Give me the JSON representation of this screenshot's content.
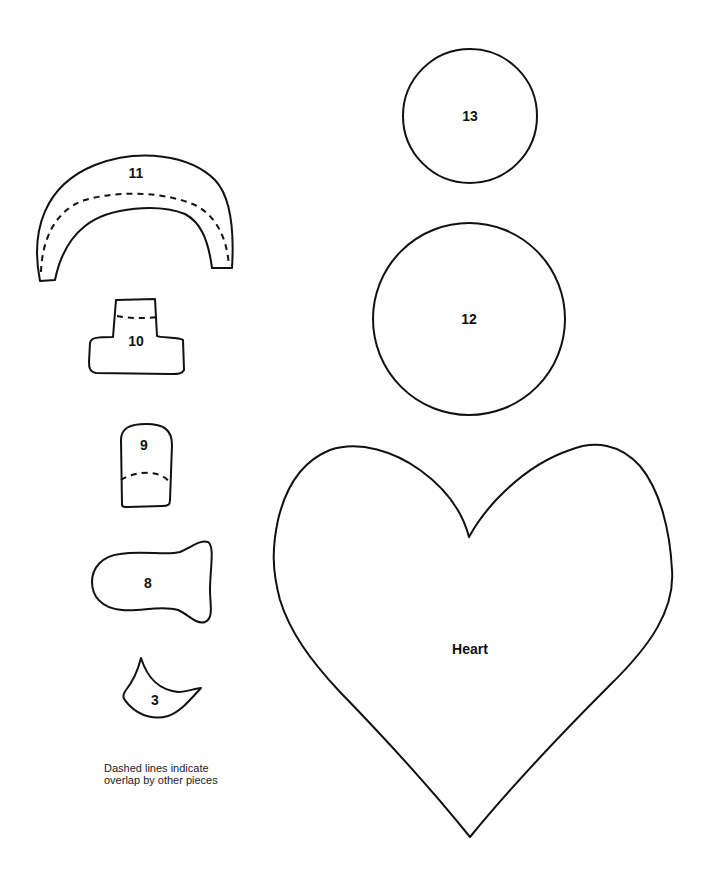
{
  "pieces": {
    "piece_11": {
      "label": "11",
      "has_dashed_overlap": true
    },
    "piece_10": {
      "label": "10",
      "has_dashed_overlap": true
    },
    "piece_9": {
      "label": "9",
      "has_dashed_overlap": true
    },
    "piece_8": {
      "label": "8",
      "has_dashed_overlap": false
    },
    "piece_3": {
      "label": "3",
      "has_dashed_overlap": false
    },
    "piece_13": {
      "label": "13",
      "shape": "circle"
    },
    "piece_12": {
      "label": "12",
      "shape": "circle"
    },
    "heart": {
      "label": "Heart",
      "shape": "heart"
    }
  },
  "note": {
    "line1": "Dashed lines indicate",
    "line2": "overlap by other pieces"
  },
  "colors": {
    "background": "#ffffff",
    "stroke": "#111111"
  }
}
